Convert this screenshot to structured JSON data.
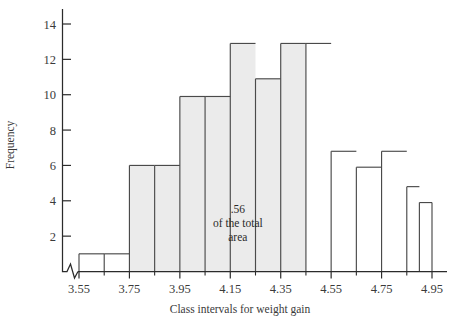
{
  "chart_data": {
    "type": "bar",
    "title": "",
    "xlabel": "Class intervals for weight gain",
    "ylabel": "Frequency",
    "xlim": [
      3.45,
      4.95
    ],
    "ylim": [
      0,
      15
    ],
    "grid": false,
    "legend": null,
    "axis_break": true,
    "x_tick_labels": [
      "3.55",
      "3.75",
      "3.95",
      "4.15",
      "4.35",
      "4.55",
      "4.75",
      "4.95"
    ],
    "x_tick_values": [
      3.55,
      3.75,
      3.95,
      4.15,
      4.35,
      4.55,
      4.75,
      4.95
    ],
    "y_tick_labels": [
      "2",
      "4",
      "6",
      "8",
      "10",
      "12",
      "14"
    ],
    "y_tick_values": [
      2,
      4,
      6,
      8,
      10,
      12,
      14
    ],
    "bin_width": 0.1,
    "categories": [
      "3.55-3.65",
      "3.65-3.75",
      "3.75-3.85",
      "3.85-3.95",
      "3.95-4.05",
      "4.05-4.15",
      "4.15-4.25",
      "4.25-4.35",
      "4.35-4.45",
      "4.45-4.55",
      "4.55-4.65",
      "4.65-4.75",
      "4.75-4.85",
      "4.85-4.95"
    ],
    "bins": [
      {
        "x0": 3.55,
        "x1": 3.65,
        "value": 1,
        "shaded": false
      },
      {
        "x0": 3.65,
        "x1": 3.75,
        "value": 1,
        "shaded": false
      },
      {
        "x0": 3.75,
        "x1": 3.85,
        "value": 6,
        "shaded": true
      },
      {
        "x0": 3.85,
        "x1": 3.95,
        "value": 6,
        "shaded": true
      },
      {
        "x0": 3.95,
        "x1": 4.05,
        "value": 9.9,
        "shaded": true
      },
      {
        "x0": 4.05,
        "x1": 4.15,
        "value": 9.9,
        "shaded": true
      },
      {
        "x0": 4.15,
        "x1": 4.25,
        "value": 12.9,
        "shaded": true
      },
      {
        "x0": 4.25,
        "x1": 4.35,
        "value": 10.9,
        "shaded": true
      },
      {
        "x0": 4.35,
        "x1": 4.45,
        "value": 12.9,
        "shaded": true
      },
      {
        "x0": 4.45,
        "x1": 4.55,
        "value": 12.9,
        "shaded": false
      },
      {
        "x0": 4.55,
        "x1": 4.65,
        "value": 6.8,
        "shaded": false
      },
      {
        "x0": 4.65,
        "x1": 4.75,
        "value": 5.9,
        "shaded": false
      },
      {
        "x0": 4.75,
        "x1": 4.85,
        "value": 6.8,
        "shaded": false
      },
      {
        "x0": 4.85,
        "x1": 4.9,
        "value": 4.8,
        "shaded": false
      },
      {
        "x0": 4.9,
        "x1": 4.95,
        "value": 3.9,
        "shaded": false
      }
    ],
    "annotations": [
      {
        "name": "shaded-area-note",
        "lines": [
          "  .56",
          "of the total",
          "area"
        ],
        "x": 4.18,
        "y": 3.3
      }
    ]
  }
}
